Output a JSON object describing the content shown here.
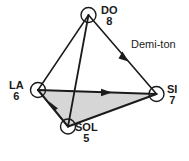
{
  "diagram": {
    "type": "tetrahedron-graph",
    "background_color": "#ffffff",
    "stroke_color": "#1b1b1b",
    "face_fill_color": "#d6d6d6",
    "node_fill_color": "#ffffff",
    "nodes": [
      {
        "id": "do",
        "name": "DO",
        "number": "8",
        "cx": 88.5,
        "cy": 15.0,
        "r": 7.5
      },
      {
        "id": "la",
        "name": "LA",
        "number": "6",
        "cx": 38.0,
        "cy": 90.0,
        "r": 7.5
      },
      {
        "id": "si",
        "name": "SI",
        "number": "7",
        "cx": 156.5,
        "cy": 94.0,
        "r": 7.5
      },
      {
        "id": "sol",
        "name": "SOL",
        "number": "5",
        "cx": 68.0,
        "cy": 126.5,
        "r": 7.5
      }
    ],
    "edges": [
      {
        "id": "do-la",
        "from": "do",
        "to": "la",
        "arrow": "none"
      },
      {
        "id": "do-si",
        "from": "do",
        "to": "si",
        "arrow": "toward-si",
        "label": "Demi-ton"
      },
      {
        "id": "do-sol",
        "from": "do",
        "to": "sol",
        "arrow": "none"
      },
      {
        "id": "la-si",
        "from": "la",
        "to": "si",
        "arrow": "toward-si"
      },
      {
        "id": "sol-la",
        "from": "sol",
        "to": "la",
        "arrow": "toward-la"
      },
      {
        "id": "sol-si",
        "from": "sol",
        "to": "si",
        "arrow": "none"
      }
    ],
    "shaded_face": [
      "la",
      "si",
      "sol"
    ],
    "edge_label": {
      "text": "Demi-ton",
      "x": 131,
      "y": 38
    },
    "labels": {
      "do": {
        "name": "DO",
        "number": "8",
        "x": 101,
        "y": 6,
        "align": "left"
      },
      "la": {
        "name": "LA",
        "number": "6",
        "x": 9,
        "y": 80,
        "align": "right"
      },
      "si": {
        "name": "SI",
        "number": "7",
        "x": 167,
        "y": 84,
        "align": "left"
      },
      "sol": {
        "name": "SOL",
        "number": "5",
        "x": 75,
        "y": 122,
        "align": "left"
      }
    }
  }
}
